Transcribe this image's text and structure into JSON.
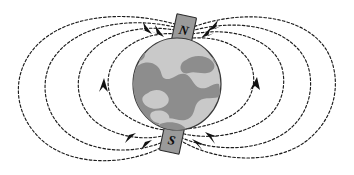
{
  "figure": {
    "background_color": "#ffffff"
  },
  "globe": {
    "name": "earth",
    "ocean_color": "#c9c9c9",
    "land_color": "#8d8d8d",
    "outline_color": "#3a3a3a",
    "center_x": 177,
    "center_y": 84,
    "radius_x": 44,
    "radius_y": 46
  },
  "magnets": [
    {
      "id": "north-pole-magnet",
      "label": "N",
      "position": "top",
      "center_x": 184,
      "center_y": 29,
      "width": 20,
      "height": 27,
      "rotation_deg": 12,
      "fill_color": "#9a9a9a",
      "stroke_color": "#2b2b2b"
    },
    {
      "id": "south-pole-magnet",
      "label": "S",
      "position": "bottom",
      "center_x": 172,
      "center_y": 139,
      "width": 20,
      "height": 27,
      "rotation_deg": 12,
      "fill_color": "#9a9a9a",
      "stroke_color": "#2b2b2b"
    }
  ],
  "field": {
    "line_color": "#1c1c1c",
    "line_style": "dashed",
    "arrow_color": "#121212",
    "direction_note": "Field lines enter at the north pole and exit at the south pole",
    "loop_count": 8,
    "arrow_count": 10
  },
  "legend": {
    "north_label": "N",
    "south_label": "S"
  }
}
